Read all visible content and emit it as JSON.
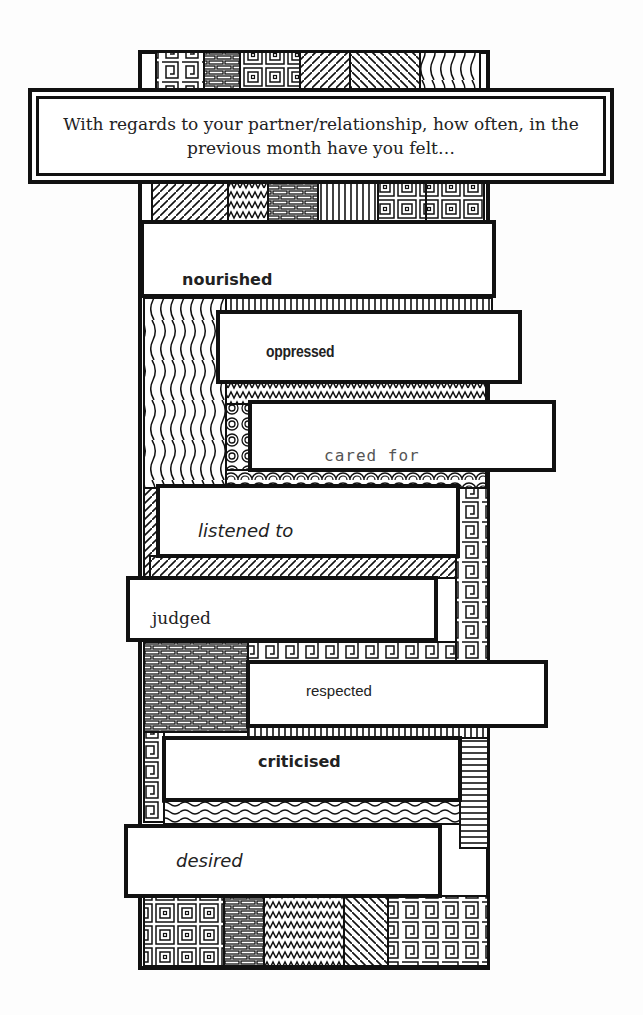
{
  "question": "With regards to your partner/relationship, how often, in the previous month have you felt…",
  "feelings": [
    {
      "label": "nourished"
    },
    {
      "label": "oppressed"
    },
    {
      "label": "cared for"
    },
    {
      "label": "listened to"
    },
    {
      "label": "judged"
    },
    {
      "label": "respected"
    },
    {
      "label": "criticised"
    },
    {
      "label": "desired"
    }
  ],
  "colors": {
    "ink": "#111111",
    "paper": "#fdfdfd"
  }
}
